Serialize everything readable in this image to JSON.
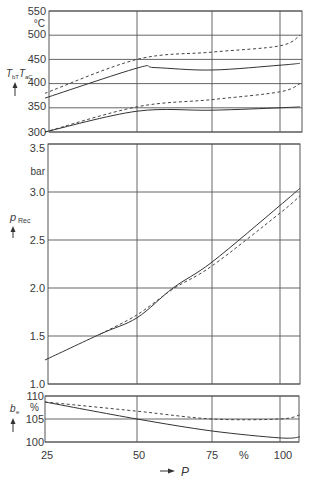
{
  "chart_data": {
    "type": "line",
    "title": "",
    "x_axis": {
      "label": "P",
      "unit": "%",
      "ticks": [
        25,
        50,
        75,
        100
      ],
      "range": [
        25,
        110
      ],
      "pixel_map": {
        "25": 45,
        "50": 137,
        "75": 212,
        "100": 280,
        "110": 300
      }
    },
    "panels": [
      {
        "id": "temperature",
        "ylabel": "T_bT T_aC",
        "ylabel_main": "T",
        "ylabel_sub1": "bT",
        "ylabel_sub2": "aC",
        "unit": "°C",
        "ylim": [
          300,
          550
        ],
        "yticks": [
          300,
          350,
          400,
          450,
          500,
          550
        ],
        "px": {
          "top": 11,
          "bottom": 132,
          "left": 49,
          "right": 302
        },
        "series": [
          {
            "name": "upper dashed",
            "style": "dashed",
            "x": [
              25,
              50,
              75,
              100,
              110
            ],
            "y": [
              380,
              450,
              465,
              478,
              500
            ]
          },
          {
            "name": "upper solid",
            "style": "solid",
            "x": [
              25,
              50,
              56,
              75,
              100,
              110
            ],
            "y": [
              370,
              432,
              433,
              428,
              438,
              442
            ]
          },
          {
            "name": "lower dashed",
            "style": "dashed",
            "x": [
              25,
              50,
              75,
              100,
              110
            ],
            "y": [
              300,
              352,
              367,
              383,
              400
            ]
          },
          {
            "name": "lower solid",
            "style": "solid",
            "x": [
              25,
              50,
              75,
              100,
              110
            ],
            "y": [
              300,
              343,
              345,
              350,
              352
            ]
          }
        ]
      },
      {
        "id": "pressure",
        "ylabel": "p_Rec",
        "ylabel_main": "p",
        "ylabel_sub": "Rec",
        "unit": "bar",
        "ylim": [
          1.0,
          3.5
        ],
        "yticks": [
          1.0,
          1.5,
          2.0,
          2.5,
          3.0,
          3.5
        ],
        "ytick_labels": [
          "1.0",
          "1.5",
          "2.0",
          "2.5",
          "3.0",
          "3.5"
        ],
        "px": {
          "top": 144,
          "bottom": 384,
          "left": 48,
          "right": 300
        },
        "series": [
          {
            "name": "solid",
            "style": "solid",
            "x": [
              25,
              40,
              50,
              62,
              75,
              100,
              110
            ],
            "y": [
              1.25,
              1.52,
              1.69,
              2.0,
              2.27,
              2.86,
              3.04
            ]
          },
          {
            "name": "dashed",
            "style": "dashed",
            "x": [
              40,
              50,
              62,
              75,
              100,
              110
            ],
            "y": [
              1.52,
              1.72,
              1.99,
              2.23,
              2.78,
              2.96
            ]
          }
        ]
      },
      {
        "id": "efficiency",
        "ylabel": "b_e",
        "ylabel_main": "b",
        "ylabel_sub": "e",
        "unit": "%",
        "ylim": [
          100,
          110
        ],
        "yticks": [
          100,
          105,
          110
        ],
        "px": {
          "top": 396,
          "bottom": 442,
          "left": 45,
          "right": 299
        },
        "series": [
          {
            "name": "solid",
            "style": "solid",
            "x": [
              25,
              50,
              75,
              100,
              110
            ],
            "y": [
              108.7,
              105.0,
              102.4,
              100.9,
              101.1
            ]
          },
          {
            "name": "dashed",
            "style": "dashed",
            "x": [
              25,
              50,
              75,
              100,
              110
            ],
            "y": [
              108.7,
              106.7,
              105.0,
              105.0,
              105.9
            ]
          }
        ]
      }
    ],
    "grid": true,
    "legend": null
  },
  "labels": {
    "temp_unit": "°C",
    "temp_ylabel_T": "T",
    "temp_ylabel_sub1": "bT",
    "temp_ylabel_sub2": "aC",
    "pressure_unit": "bar",
    "pressure_ylabel": "p",
    "pressure_ylabel_sub": "Rec",
    "eff_unit": "%",
    "eff_ylabel": "b",
    "eff_ylabel_sub": "e",
    "x_tick_25": "25",
    "x_tick_50": "50",
    "x_tick_75": "75",
    "x_unit": "%",
    "x_tick_100": "100",
    "x_axis_label": "P",
    "t550": "550",
    "t500": "500",
    "t450": "450",
    "t400": "400",
    "t350": "350",
    "t300": "300",
    "p35": "3.5",
    "p30": "3.0",
    "p25": "2.5",
    "p20": "2.0",
    "p15": "1.5",
    "p10": "1.0",
    "e110": "110",
    "e105": "105",
    "e100": "100"
  }
}
